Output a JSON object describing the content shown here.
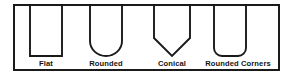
{
  "diagram": {
    "frame": {
      "name": "outer-border",
      "stroke_color": "#1a1a1a",
      "background_color": "#ffffff"
    },
    "shapes": [
      {
        "id": "flat",
        "label": "Flat",
        "bottom_type": "flat",
        "label_x": 46,
        "center_x": 46
      },
      {
        "id": "rounded",
        "label": "Rounded",
        "bottom_type": "semicircular",
        "label_x": 106,
        "center_x": 106
      },
      {
        "id": "conical",
        "label": "Conical",
        "bottom_type": "v-point",
        "label_x": 172,
        "center_x": 172
      },
      {
        "id": "rounded-corners",
        "label": "Rounded Corners",
        "bottom_type": "flat-with-radius",
        "label_x": 238,
        "center_x": 230
      }
    ],
    "stroke_color": "#1a1a1a",
    "label_color": "#141414"
  }
}
